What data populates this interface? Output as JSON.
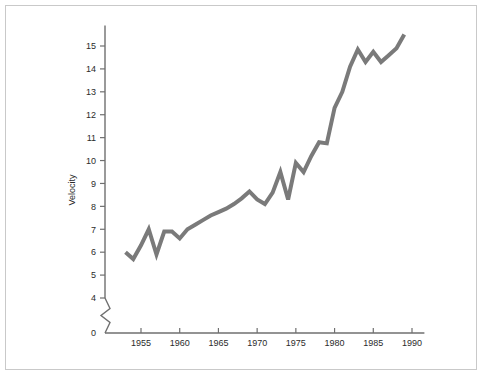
{
  "figure": {
    "background_color": "#ffffff",
    "border_color": "#c9c9c9",
    "axis_color": "#6f6f6f",
    "text_color": "#2b2b2b"
  },
  "chart_data": {
    "type": "line",
    "title": "",
    "subtitle": "",
    "xlabel": "",
    "ylabel": "Velocity",
    "series_name": "Velocity",
    "line_color": "#7a7a7a",
    "line_width": 4,
    "grid": false,
    "legend": false,
    "legend_position": "none",
    "axis_break": true,
    "axis_break_between": [
      0,
      4
    ],
    "xlim": [
      1951.5,
      1991.5
    ],
    "ylim": [
      3.4,
      15.9
    ],
    "xticks": [
      1955,
      1960,
      1965,
      1970,
      1975,
      1980,
      1985,
      1990
    ],
    "xtick_labels": [
      "1955",
      "1960",
      "1965",
      "1970",
      "1975",
      "1980",
      "1985",
      "1990"
    ],
    "yticks": [
      0,
      4,
      5,
      6,
      7,
      8,
      9,
      10,
      11,
      12,
      13,
      14,
      15
    ],
    "ytick_labels": [
      "0",
      "4",
      "5",
      "6",
      "7",
      "8",
      "9",
      "10",
      "11",
      "12",
      "13",
      "14",
      "15"
    ],
    "x": [
      1953,
      1954,
      1955,
      1956,
      1957,
      1958,
      1959,
      1960,
      1961,
      1962,
      1963,
      1964,
      1965,
      1966,
      1967,
      1968,
      1969,
      1970,
      1971,
      1972,
      1973,
      1974,
      1975,
      1976,
      1977,
      1978,
      1979,
      1980,
      1981,
      1982,
      1983,
      1984,
      1985,
      1986,
      1987,
      1988,
      1989
    ],
    "values": [
      6.0,
      5.7,
      6.3,
      7.0,
      5.9,
      6.9,
      6.9,
      6.6,
      7.0,
      7.2,
      7.4,
      7.6,
      7.75,
      7.9,
      8.1,
      8.35,
      8.65,
      8.3,
      8.1,
      8.6,
      9.5,
      8.3,
      9.9,
      9.5,
      10.2,
      10.8,
      10.75,
      12.3,
      13.0,
      14.1,
      14.85,
      14.3,
      14.75,
      14.3,
      14.6,
      14.9,
      15.5
    ],
    "value_range": {
      "min": 5.7,
      "max": 15.5
    }
  }
}
